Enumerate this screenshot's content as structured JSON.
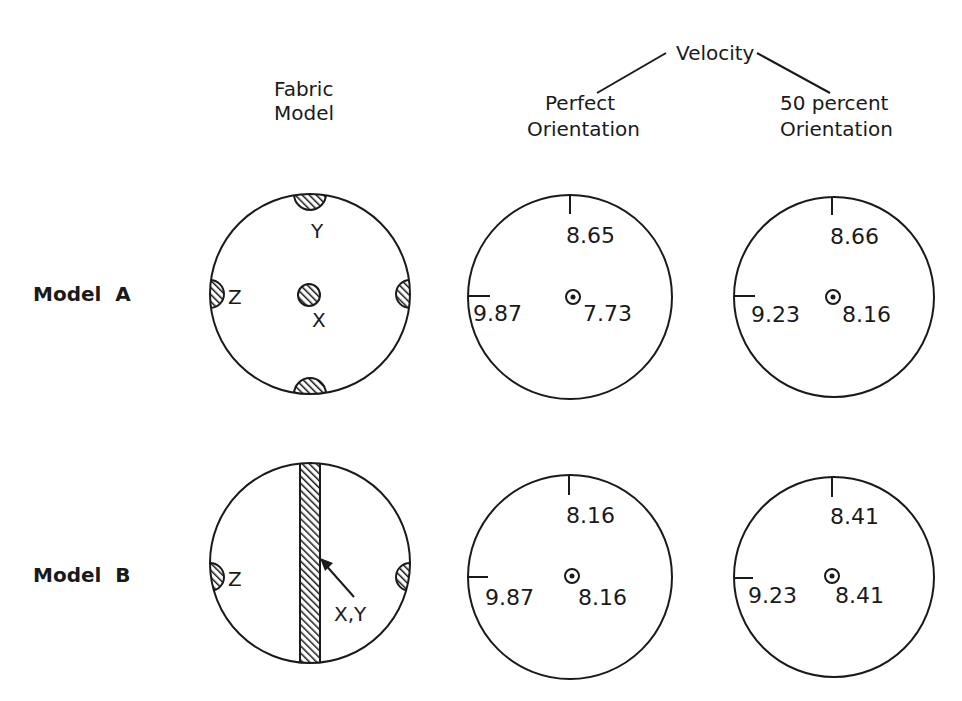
{
  "headers": {
    "fabric_model": [
      "Fabric",
      "Model"
    ],
    "velocity": "Velocity",
    "perfect": [
      "Perfect",
      "Orientation"
    ],
    "fifty": [
      "50 percent",
      "Orientation"
    ]
  },
  "rows": [
    {
      "label": "Model  A",
      "fabric": {
        "top_label": "Y",
        "left_label": "Z",
        "center_label": "X"
      },
      "perfect": {
        "top": "8.65",
        "left": "9.87",
        "center": "7.73"
      },
      "fifty": {
        "top": "8.66",
        "left": "9.23",
        "center": "8.16"
      }
    },
    {
      "label": "Model  B",
      "fabric": {
        "left_label": "Z",
        "band_label": "X,Y"
      },
      "perfect": {
        "top": "8.16",
        "left": "9.87",
        "center": "8.16"
      },
      "fifty": {
        "top": "8.41",
        "left": "9.23",
        "center": "8.41"
      }
    }
  ],
  "colors": {
    "ink": "#1a1a1a",
    "background": "#ffffff"
  }
}
